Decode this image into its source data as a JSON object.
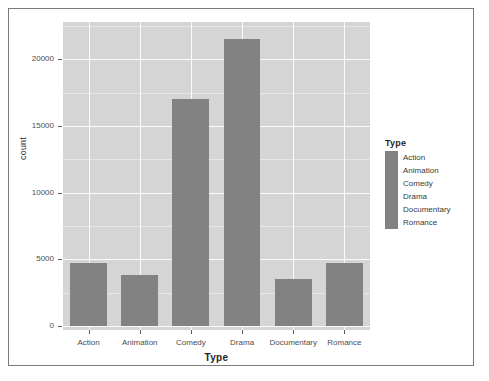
{
  "figure": {
    "frame_visible": true,
    "background_color": "#ffffff",
    "panel_color": "#d5d5d5",
    "bar_color": "#828282",
    "gridline_color": "#fbfbfb"
  },
  "chart_data": {
    "type": "bar",
    "title": "",
    "xlabel": "Type",
    "ylabel": "count",
    "categories": [
      "Action",
      "Animation",
      "Comedy",
      "Drama",
      "Documentary",
      "Romance"
    ],
    "values": [
      4700,
      3800,
      17000,
      21500,
      3500,
      4700
    ],
    "ylim": [
      0,
      22500
    ],
    "yticks": [
      0,
      5000,
      10000,
      15000,
      20000
    ],
    "ytick_labels": [
      "0",
      "5000",
      "10000",
      "15000",
      "20000"
    ],
    "grid": true,
    "legend": {
      "title": "Type",
      "position": "right",
      "entries": [
        {
          "label": "Action",
          "color": "#828282"
        },
        {
          "label": "Animation",
          "color": "#828282"
        },
        {
          "label": "Comedy",
          "color": "#828282"
        },
        {
          "label": "Drama",
          "color": "#828282"
        },
        {
          "label": "Documentary",
          "color": "#828282"
        },
        {
          "label": "Romance",
          "color": "#828282"
        }
      ]
    }
  }
}
